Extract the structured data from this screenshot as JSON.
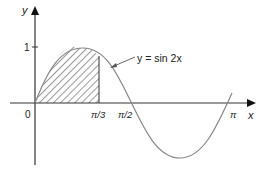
{
  "figure": {
    "function_label": "y = sin 2x",
    "axes": {
      "x_label": "x",
      "y_label": "y"
    },
    "ticks": {
      "origin": "0",
      "y_one": "1",
      "x_pi_third": "π/3",
      "x_pi_half": "π/2",
      "x_pi": "π"
    },
    "shaded_region": {
      "from": "0",
      "to": "π/3",
      "description": "area under y = sin 2x between x = 0 and x = π/3"
    },
    "colors": {
      "curve": "#888888",
      "axes": "#333333",
      "hatch": "#333333"
    }
  }
}
